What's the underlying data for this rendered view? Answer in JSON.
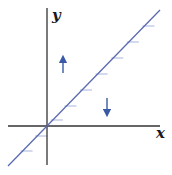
{
  "diagram": {
    "type": "phase-line / slope-field sketch",
    "axes": {
      "x_label": "x",
      "y_label": "y",
      "origin": [
        47,
        126
      ],
      "x_axis": {
        "from": [
          8,
          126
        ],
        "to": [
          160,
          126
        ]
      },
      "y_axis": {
        "from": [
          47,
          8
        ],
        "to": [
          47,
          165
        ]
      }
    },
    "line": {
      "description": "diagonal line through origin (y = x)",
      "from": [
        8,
        166
      ],
      "to": [
        160,
        10
      ],
      "color": "#5a6bb0"
    },
    "ticks": {
      "color": "#a9b4dc",
      "length": 12,
      "y_positions": [
        26,
        42,
        58,
        74,
        90,
        106,
        120,
        136,
        151
      ]
    },
    "arrows": [
      {
        "name": "up-arrow",
        "direction": "up",
        "x": 63,
        "y_top": 55,
        "y_bottom": 73,
        "color": "#3b5aa6"
      },
      {
        "name": "down-arrow",
        "direction": "down",
        "x": 107,
        "y_top": 98,
        "y_bottom": 117,
        "color": "#3b5aa6"
      }
    ],
    "colors": {
      "axis": "#333333",
      "line": "#5a6bb0",
      "arrow": "#3b5aa6",
      "tick": "#a9b4dc"
    }
  }
}
